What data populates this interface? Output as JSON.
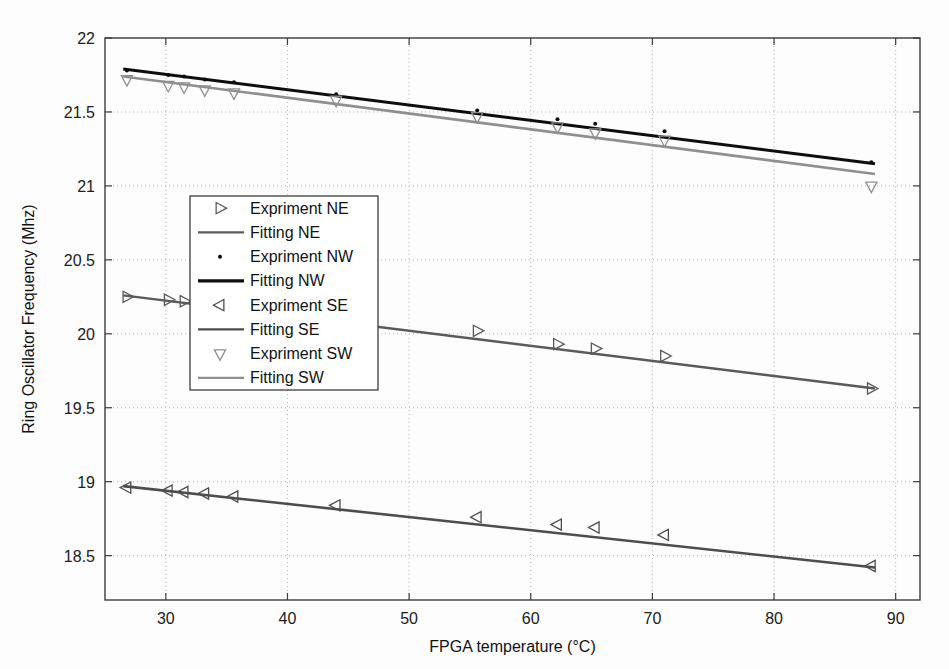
{
  "chart_data": {
    "type": "line",
    "title": "",
    "xlabel": "FPGA temperature (°C)",
    "ylabel": "Ring Oscillator Frequency (Mhz)",
    "xlim": [
      25,
      92
    ],
    "ylim": [
      18.2,
      22
    ],
    "xticks": [
      30,
      40,
      50,
      60,
      70,
      80,
      90
    ],
    "xtick_labels": [
      "30",
      "40",
      "50",
      "60",
      "70",
      "80",
      "90"
    ],
    "yticks": [
      18.5,
      19,
      19.5,
      20,
      20.5,
      21,
      21.5,
      22
    ],
    "ytick_labels": [
      "18.5",
      "19",
      "19.5",
      "20",
      "20.5",
      "21",
      "21.5",
      "22"
    ],
    "grid": true,
    "grid_style": "dotted",
    "legend_position": "center-left",
    "series": [
      {
        "name": "Expriment NE",
        "kind": "scatter",
        "marker": "triangle-right",
        "color": "#5a5a5a",
        "x": [
          26.8,
          30.2,
          31.5,
          33.2,
          35.6,
          44.0,
          55.6,
          62.2,
          65.3,
          71.0,
          88.0
        ],
        "y": [
          20.25,
          20.23,
          20.22,
          20.21,
          20.2,
          20.06,
          20.02,
          19.93,
          19.9,
          19.85,
          19.63
        ]
      },
      {
        "name": "Fitting NE",
        "kind": "line",
        "color": "#5a5a5a",
        "linewidth": 2.4,
        "x": [
          26.5,
          88.3
        ],
        "y": [
          20.26,
          19.63
        ]
      },
      {
        "name": "Expriment NW",
        "kind": "scatter",
        "marker": "dot",
        "color": "#0d0d0d",
        "x": [
          26.8,
          30.2,
          31.5,
          33.2,
          35.6,
          44.0,
          55.6,
          62.2,
          65.3,
          71.0,
          88.0
        ],
        "y": [
          21.78,
          21.75,
          21.74,
          21.72,
          21.7,
          21.62,
          21.51,
          21.45,
          21.42,
          21.37,
          21.16
        ]
      },
      {
        "name": "Fitting NW",
        "kind": "line",
        "color": "#0d0d0d",
        "linewidth": 3.0,
        "x": [
          26.5,
          88.3
        ],
        "y": [
          21.79,
          21.15
        ]
      },
      {
        "name": "Expriment SE",
        "kind": "scatter",
        "marker": "triangle-left",
        "color": "#4d4d4d",
        "x": [
          26.8,
          30.2,
          31.5,
          33.2,
          35.6,
          44.0,
          55.6,
          62.2,
          65.3,
          71.0,
          88.0
        ],
        "y": [
          18.96,
          18.94,
          18.93,
          18.92,
          18.9,
          18.84,
          18.76,
          18.71,
          18.69,
          18.64,
          18.43
        ]
      },
      {
        "name": "Fitting SE",
        "kind": "line",
        "color": "#4d4d4d",
        "linewidth": 2.6,
        "x": [
          26.5,
          88.3
        ],
        "y": [
          18.97,
          18.42
        ]
      },
      {
        "name": "Expriment SW",
        "kind": "scatter",
        "marker": "triangle-down",
        "color": "#8f8f8f",
        "x": [
          26.8,
          30.2,
          31.5,
          33.2,
          35.6,
          44.0,
          55.6,
          62.2,
          65.3,
          71.0,
          88.0
        ],
        "y": [
          21.72,
          21.68,
          21.67,
          21.65,
          21.63,
          21.58,
          21.47,
          21.4,
          21.36,
          21.31,
          21.0
        ]
      },
      {
        "name": "Fitting SW",
        "kind": "line",
        "color": "#8f8f8f",
        "linewidth": 2.6,
        "x": [
          26.5,
          88.3
        ],
        "y": [
          21.74,
          21.08
        ]
      }
    ]
  },
  "legend": {
    "entries": [
      {
        "label": "Expriment NE",
        "marker": "triangle-right",
        "color": "#5a5a5a"
      },
      {
        "label": "Fitting NE",
        "marker": "line",
        "color": "#5a5a5a"
      },
      {
        "label": "Expriment NW",
        "marker": "dot",
        "color": "#0d0d0d"
      },
      {
        "label": "Fitting NW",
        "marker": "line",
        "color": "#0d0d0d"
      },
      {
        "label": "Expriment SE",
        "marker": "triangle-left",
        "color": "#4d4d4d"
      },
      {
        "label": "Fitting SE",
        "marker": "line",
        "color": "#4d4d4d"
      },
      {
        "label": "Expriment SW",
        "marker": "triangle-down",
        "color": "#8f8f8f"
      },
      {
        "label": "Fitting SW",
        "marker": "line",
        "color": "#8f8f8f"
      }
    ]
  },
  "colors": {
    "axis": "#3c3c3c",
    "grid": "#b4b4b4",
    "background": "#fdfdfd",
    "text": "#161616"
  }
}
